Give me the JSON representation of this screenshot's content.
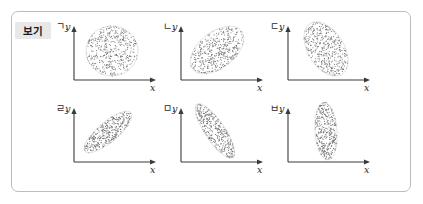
{
  "figure": {
    "box_label": "보기",
    "border_color": "#b9bcc0",
    "chip_bg": "#e8e8e8"
  },
  "axes": {
    "x_label": "x",
    "y_label": "y",
    "axis_color": "#3a3a3a",
    "dot_color": "#6e6e6e"
  },
  "chart_data": {
    "type": "scatter",
    "title": "보기",
    "xlabel": "x",
    "ylabel": "y",
    "grid": false,
    "legend": "none",
    "panel_layout": {
      "rows": 2,
      "cols": 3
    },
    "panels": [
      {
        "key": "g",
        "label": "ㄱ.",
        "row": 0,
        "col": 0,
        "shape": "circular-cloud",
        "orientation_deg": 0,
        "semi_major": 26,
        "semi_minor": 25,
        "center": [
          62,
          33
        ],
        "n_points": 430,
        "correlation": "none",
        "correlation_value": 0.0
      },
      {
        "key": "n",
        "label": "ㄴ.",
        "row": 0,
        "col": 1,
        "shape": "tilted-ellipse",
        "orientation_deg": -38,
        "semi_major": 31,
        "semi_minor": 18,
        "center": [
          60,
          32
        ],
        "n_points": 430,
        "correlation": "positive",
        "correlation_value": 0.7
      },
      {
        "key": "d",
        "label": "ㄷ.",
        "row": 0,
        "col": 2,
        "shape": "tilted-ellipse",
        "orientation_deg": 58,
        "semi_major": 30,
        "semi_minor": 18,
        "center": [
          62,
          31
        ],
        "n_points": 430,
        "correlation": "negative",
        "correlation_value": -0.7
      },
      {
        "key": "r",
        "label": "ㄹ.",
        "row": 1,
        "col": 0,
        "shape": "narrow-tilted-ellipse",
        "orientation_deg": -40,
        "semi_major": 30,
        "semi_minor": 10,
        "center": [
          58,
          32
        ],
        "n_points": 380,
        "correlation": "strong-positive",
        "correlation_value": 0.95
      },
      {
        "key": "m",
        "label": "ㅁ.",
        "row": 1,
        "col": 1,
        "shape": "narrow-tilted-ellipse",
        "orientation_deg": 56,
        "semi_major": 32,
        "semi_minor": 10,
        "center": [
          58,
          31
        ],
        "n_points": 380,
        "correlation": "strong-negative",
        "correlation_value": -0.95
      },
      {
        "key": "b",
        "label": "ㅂ.",
        "row": 1,
        "col": 2,
        "shape": "vertical-ellipse",
        "orientation_deg": 86,
        "semi_major": 29,
        "semi_minor": 11,
        "center": [
          62,
          31
        ],
        "n_points": 380,
        "correlation": "none-vertical",
        "correlation_value": 0.0
      }
    ]
  }
}
